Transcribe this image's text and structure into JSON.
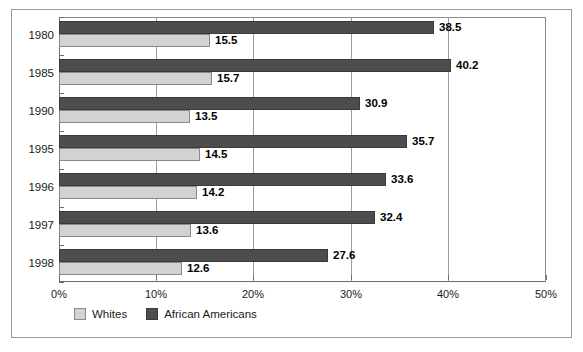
{
  "chart_data": {
    "type": "bar",
    "orientation": "horizontal",
    "title": "",
    "subtitle": "",
    "xlabel": "",
    "ylabel": "",
    "categories": [
      "1980",
      "1985",
      "1990",
      "1995",
      "1996",
      "1997",
      "1998"
    ],
    "series": [
      {
        "name": "Whites",
        "color": "#d2d2d2",
        "values": [
          15.5,
          15.7,
          13.5,
          14.5,
          14.2,
          13.6,
          12.6
        ]
      },
      {
        "name": "African Americans",
        "color": "#4d4d4d",
        "values": [
          38.5,
          40.2,
          30.9,
          35.7,
          33.6,
          32.4,
          27.6
        ]
      }
    ],
    "xlim": [
      0,
      50
    ],
    "xticks": [
      0,
      10,
      20,
      30,
      40,
      50
    ],
    "xtick_labels": [
      "0%",
      "10%",
      "20%",
      "30%",
      "40%",
      "50%"
    ],
    "grid": true,
    "grid_axis": "x",
    "legend_position": "bottom-left",
    "data_labels": true,
    "data_label_format": "one-decimal"
  },
  "legend": {
    "entries": [
      {
        "label": "Whites",
        "swatch": "light-gray-square"
      },
      {
        "label": "African Americans",
        "swatch": "dark-gray-square"
      }
    ]
  },
  "colors": {
    "whites_fill": "#d2d2d2",
    "african_americans_fill": "#4d4d4d",
    "gridline": "#9c9c9c",
    "axis": "#6d6d6d",
    "frame": "#9a9a9a",
    "text": "#1a1a1a",
    "background": "#ffffff"
  }
}
